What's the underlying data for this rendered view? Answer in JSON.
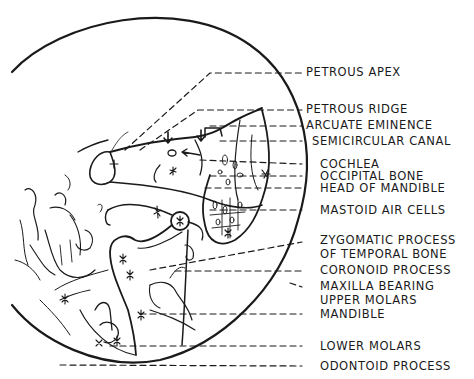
{
  "diagram": {
    "type": "anatomical-line-drawing",
    "ink_color": "#1a1a1a",
    "background": "#ffffff",
    "labels": [
      {
        "id": "petrous-apex",
        "text": "PETROUS APEX",
        "y": 72
      },
      {
        "id": "petrous-ridge",
        "text": "PETROUS RIDGE",
        "y": 109
      },
      {
        "id": "arcuate-eminence",
        "text": "ARCUATE EMINENCE",
        "y": 125
      },
      {
        "id": "semicircular-canal",
        "text": "SEMICIRCULAR CANAL",
        "y": 141
      },
      {
        "id": "cochlea",
        "text": "COCHLEA",
        "y": 164
      },
      {
        "id": "occipital-bone",
        "text": "OCCIPITAL BONE",
        "y": 176
      },
      {
        "id": "head-of-mandible",
        "text": "HEAD OF MANDIBLE",
        "y": 188
      },
      {
        "id": "mastoid-air-cells",
        "text": "MASTOID AIR CELLS",
        "y": 210
      },
      {
        "id": "zygomatic-process",
        "text": "ZYGOMATIC PROCESS",
        "text2": "OF TEMPORAL BONE",
        "y": 240
      },
      {
        "id": "coronoid-process",
        "text": "CORONOID PROCESS",
        "y": 270
      },
      {
        "id": "maxilla-bearing",
        "text": "MAXILLA BEARING",
        "text2": "UPPER MOLARS",
        "y": 287
      },
      {
        "id": "mandible",
        "text": "MANDIBLE",
        "y": 314
      },
      {
        "id": "lower-molars",
        "text": "LOWER MOLARS",
        "y": 346
      },
      {
        "id": "odontoid-process",
        "text": "ODONTOID PROCESS",
        "y": 366
      }
    ]
  }
}
